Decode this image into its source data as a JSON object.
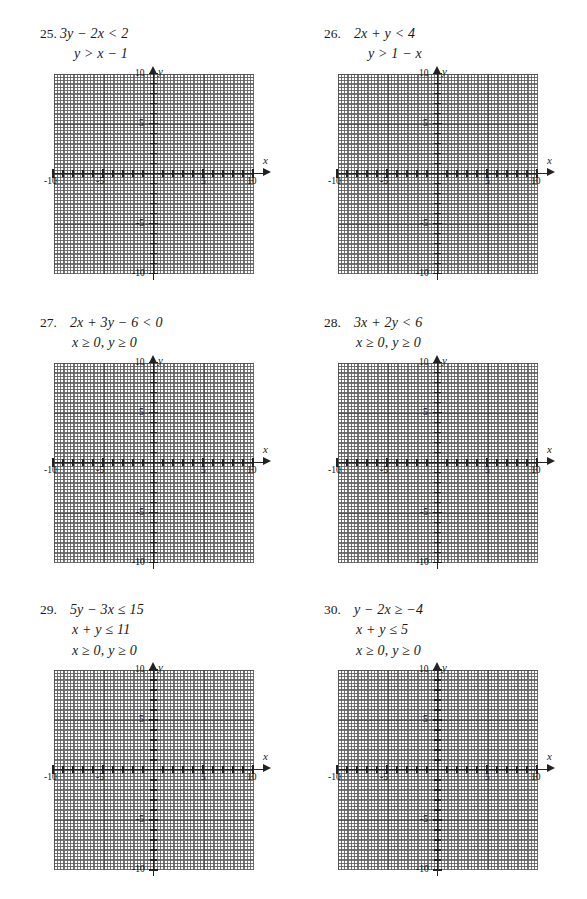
{
  "page": {
    "kind": "math-worksheet",
    "background_color": "#ffffff",
    "ink_color": "#1a1a1a"
  },
  "graph_template": {
    "x_axis_label": "x",
    "y_axis_label": "y",
    "x_min": -10,
    "x_max": 10,
    "y_min": -10,
    "y_max": 10,
    "unit_step": 1,
    "major_step": 5,
    "x_tick_labels": [
      "-10",
      "-5",
      "5",
      "10"
    ],
    "y_tick_labels": [
      "10",
      "5",
      "-5",
      "-10"
    ],
    "grid": "dotted-unit-with-major-lines",
    "plotted_curves": "none"
  },
  "problems": [
    {
      "number": "25.",
      "number_spacing": "tight",
      "lines": [
        "3y − 2x < 2",
        "y > x − 1"
      ]
    },
    {
      "number": "26.",
      "number_spacing": "wide",
      "lines": [
        "2x + y < 4",
        "y > 1 − x"
      ]
    },
    {
      "number": "27.",
      "number_spacing": "wide",
      "lines": [
        "2x + 3y − 6 < 0",
        "x ≥ 0,  y ≥ 0"
      ]
    },
    {
      "number": "28.",
      "number_spacing": "wide",
      "lines": [
        "3x + 2y < 6",
        "x ≥ 0,  y ≥ 0"
      ]
    },
    {
      "number": "29.",
      "number_spacing": "wide",
      "lines": [
        "5y − 3x ≤ 15",
        "x + y ≤ 11",
        "x ≥ 0,  y ≥ 0"
      ]
    },
    {
      "number": "30.",
      "number_spacing": "wide",
      "lines": [
        "y − 2x ≥ −4",
        "x + y ≤ 5",
        "x ≥ 0,  y ≥ 0"
      ]
    }
  ]
}
